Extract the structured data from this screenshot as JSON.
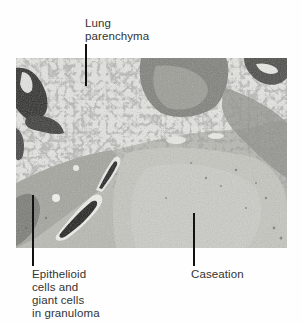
{
  "figure": {
    "type": "annotated-micrograph",
    "labels": [
      {
        "id": "lung-parenchyma",
        "text": "Lung\nparenchyma"
      },
      {
        "id": "epithelioid",
        "text": "Epithelioid\ncells and\ngiant cells\nin granuloma"
      },
      {
        "id": "caseation",
        "text": "Caseation"
      }
    ]
  },
  "colors": {
    "background": "#fefefe",
    "label_text": "#333333",
    "leader_line": "#111111",
    "tissue_light": "#d6d6d0",
    "tissue_mid": "#a8a8a2",
    "tissue_dark": "#3a3a38"
  }
}
